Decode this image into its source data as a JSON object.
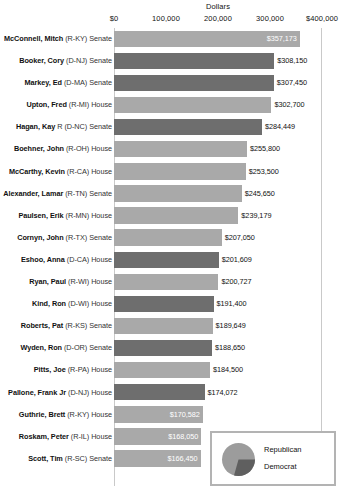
{
  "chart_data": {
    "type": "bar",
    "orientation": "horizontal",
    "title": "",
    "xlabel": "Dollars",
    "ylabel": "",
    "xlim": [
      0,
      400000
    ],
    "grid": false,
    "legend_position": "bottom-right",
    "axis_title": "Dollars",
    "tick_labels": [
      "$0",
      "100,000",
      "200,000",
      "300,000",
      "$400,000"
    ],
    "tick_values": [
      0,
      100000,
      200000,
      300000,
      400000
    ],
    "legend": {
      "entries": [
        {
          "label": "Republican",
          "color": "#a9a9a9"
        },
        {
          "label": "Democrat",
          "color": "#6e6e6e"
        }
      ]
    },
    "categories": [
      "McConnell, Mitch (R-KY) Senate",
      "Booker, Cory (D-NJ) Senate",
      "Markey, Ed (D-MA) Senate",
      "Upton, Fred (R-MI) House",
      "Hagan, Kay R (D-NC) Senate",
      "Boehner, John (R-OH) House",
      "McCarthy, Kevin (R-CA) House",
      "Alexander, Lamar (R-TN) Senate",
      "Paulsen, Erik (R-MN) House",
      "Cornyn, John (R-TX) Senate",
      "Eshoo, Anna (D-CA) House",
      "Ryan, Paul (R-WI) House",
      "Kind, Ron (D-WI) House",
      "Roberts, Pat (R-KS) Senate",
      "Wyden, Ron (D-OR) Senate",
      "Pitts, Joe (R-PA) House",
      "Pallone, Frank Jr (D-NJ) House",
      "Guthrie, Brett (R-KY) House",
      "Roskam, Peter (R-IL) House",
      "Scott, Tim (R-SC) Senate"
    ],
    "values": [
      357173,
      308150,
      307450,
      302700,
      284449,
      255800,
      253500,
      245650,
      239179,
      207050,
      201609,
      200727,
      191400,
      189649,
      188650,
      184500,
      174072,
      170582,
      168050,
      166450
    ],
    "rows": [
      {
        "name": "McConnell, Mitch",
        "meta": "(R-KY) Senate",
        "party": "rep",
        "value": 357173,
        "value_label": "$357,173",
        "label_position": "inside-right"
      },
      {
        "name": "Booker, Cory",
        "meta": "(D-NJ) Senate",
        "party": "dem",
        "value": 308150,
        "value_label": "$308,150",
        "label_position": "outside"
      },
      {
        "name": "Markey, Ed",
        "meta": "(D-MA) Senate",
        "party": "dem",
        "value": 307450,
        "value_label": "$307,450",
        "label_position": "outside"
      },
      {
        "name": "Upton, Fred",
        "meta": "(R-MI) House",
        "party": "rep",
        "value": 302700,
        "value_label": "$302,700",
        "label_position": "outside"
      },
      {
        "name": "Hagan, Kay",
        "meta": "R (D-NC) Senate",
        "party": "dem",
        "value": 284449,
        "value_label": "$284,449",
        "label_position": "outside"
      },
      {
        "name": "Boehner, John",
        "meta": "(R-OH) House",
        "party": "rep",
        "value": 255800,
        "value_label": "$255,800",
        "label_position": "outside"
      },
      {
        "name": "McCarthy, Kevin",
        "meta": "(R-CA) House",
        "party": "rep",
        "value": 253500,
        "value_label": "$253,500",
        "label_position": "outside"
      },
      {
        "name": "Alexander, Lamar",
        "meta": "(R-TN) Senate",
        "party": "rep",
        "value": 245650,
        "value_label": "$245,650",
        "label_position": "outside"
      },
      {
        "name": "Paulsen, Erik",
        "meta": "(R-MN) House",
        "party": "rep",
        "value": 239179,
        "value_label": "$239,179",
        "label_position": "outside"
      },
      {
        "name": "Cornyn, John",
        "meta": "(R-TX) Senate",
        "party": "rep",
        "value": 207050,
        "value_label": "$207,050",
        "label_position": "outside"
      },
      {
        "name": "Eshoo, Anna",
        "meta": "(D-CA) House",
        "party": "dem",
        "value": 201609,
        "value_label": "$201,609",
        "label_position": "outside"
      },
      {
        "name": "Ryan, Paul",
        "meta": "(R-WI) House",
        "party": "rep",
        "value": 200727,
        "value_label": "$200,727",
        "label_position": "outside"
      },
      {
        "name": "Kind, Ron",
        "meta": "(D-WI) House",
        "party": "dem",
        "value": 191400,
        "value_label": "$191,400",
        "label_position": "outside"
      },
      {
        "name": "Roberts, Pat",
        "meta": "(R-KS) Senate",
        "party": "rep",
        "value": 189649,
        "value_label": "$189,649",
        "label_position": "outside"
      },
      {
        "name": "Wyden, Ron",
        "meta": "(D-OR) Senate",
        "party": "dem",
        "value": 188650,
        "value_label": "$188,650",
        "label_position": "outside"
      },
      {
        "name": "Pitts, Joe",
        "meta": "(R-PA) House",
        "party": "rep",
        "value": 184500,
        "value_label": "$184,500",
        "label_position": "outside"
      },
      {
        "name": "Pallone, Frank Jr",
        "meta": "(D-NJ) House",
        "party": "dem",
        "value": 174072,
        "value_label": "$174,072",
        "label_position": "outside"
      },
      {
        "name": "Guthrie, Brett",
        "meta": "(R-KY) House",
        "party": "rep",
        "value": 170582,
        "value_label": "$170,582",
        "label_position": "inside-right"
      },
      {
        "name": "Roskam, Peter",
        "meta": "(R-IL) House",
        "party": "rep",
        "value": 168050,
        "value_label": "$168,050",
        "label_position": "inside-right"
      },
      {
        "name": "Scott, Tim",
        "meta": "(R-SC) Senate",
        "party": "rep",
        "value": 166450,
        "value_label": "$166,450",
        "label_position": "inside-right"
      }
    ]
  }
}
